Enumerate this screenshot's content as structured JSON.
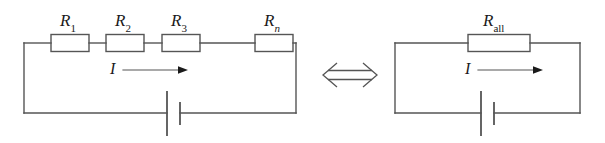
{
  "figure": {
    "type": "circuit-diagram",
    "equivalence_symbol": "⟺"
  },
  "left_circuit": {
    "name": "series-resistor-circuit",
    "resistors": [
      {
        "label_main": "R",
        "label_sub": "1",
        "sub_style": "upright",
        "full": "R1"
      },
      {
        "label_main": "R",
        "label_sub": "2",
        "sub_style": "upright",
        "full": "R2"
      },
      {
        "label_main": "R",
        "label_sub": "3",
        "sub_style": "upright",
        "full": "R3"
      },
      {
        "label_main": "R",
        "label_sub": "n",
        "sub_style": "italic",
        "full": "Rn"
      }
    ],
    "current": {
      "symbol": "I",
      "arrow": "→",
      "direction": "right"
    },
    "source": {
      "type": "battery",
      "symbol": "cell"
    }
  },
  "right_circuit": {
    "name": "equivalent-resistor-circuit",
    "resistors": [
      {
        "label_main": "R",
        "label_sub": "all",
        "sub_style": "upright",
        "full": "Rall"
      }
    ],
    "current": {
      "symbol": "I",
      "arrow": "→",
      "direction": "right"
    },
    "source": {
      "type": "battery",
      "symbol": "cell"
    }
  },
  "style": {
    "wire_color": "#555555",
    "ink_color": "#1a1a1a",
    "background": "#ffffff",
    "stroke_width": "1.4"
  }
}
